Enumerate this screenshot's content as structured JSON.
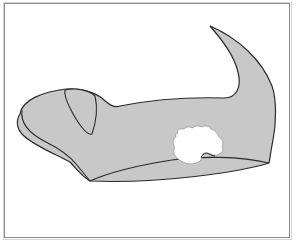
{
  "figure": {
    "type": "anatomical line illustration",
    "labels": []
  },
  "colors": {
    "frame_border": "#8a8a8a",
    "fill": "#c8c8c8",
    "outline": "#2a2a2a",
    "defect": "#ffffff",
    "background": "#ffffff"
  }
}
